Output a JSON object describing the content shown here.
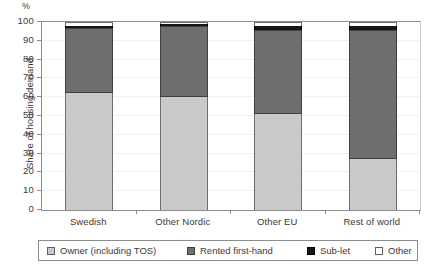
{
  "chart_data": {
    "type": "bar",
    "stacked": true,
    "title": "",
    "xlabel": "",
    "ylabel": "Share of housing demand",
    "unit_label": "%",
    "ylim": [
      0,
      100
    ],
    "yticks": [
      0,
      10,
      20,
      30,
      40,
      50,
      60,
      70,
      80,
      90,
      100
    ],
    "grid": true,
    "legend_position": "bottom",
    "categories": [
      "Swedish",
      "Other Nordic",
      "Other EU",
      "Rest of world"
    ],
    "series": [
      {
        "name": "Owner (including TOS)",
        "color": "#c9c9c9",
        "swatch": "sw-owner",
        "values": [
          62,
          60,
          51,
          27
        ]
      },
      {
        "name": "Rented first-hand",
        "color": "#6e6e6e",
        "swatch": "sw-rented",
        "values": [
          35,
          38,
          45,
          69
        ]
      },
      {
        "name": "Sub-let",
        "color": "#161616",
        "swatch": "sw-sublet",
        "values": [
          1,
          1,
          2,
          2
        ]
      },
      {
        "name": "Other",
        "color": "#ffffff",
        "swatch": "sw-other",
        "values": [
          2,
          1,
          2,
          2
        ]
      }
    ]
  }
}
